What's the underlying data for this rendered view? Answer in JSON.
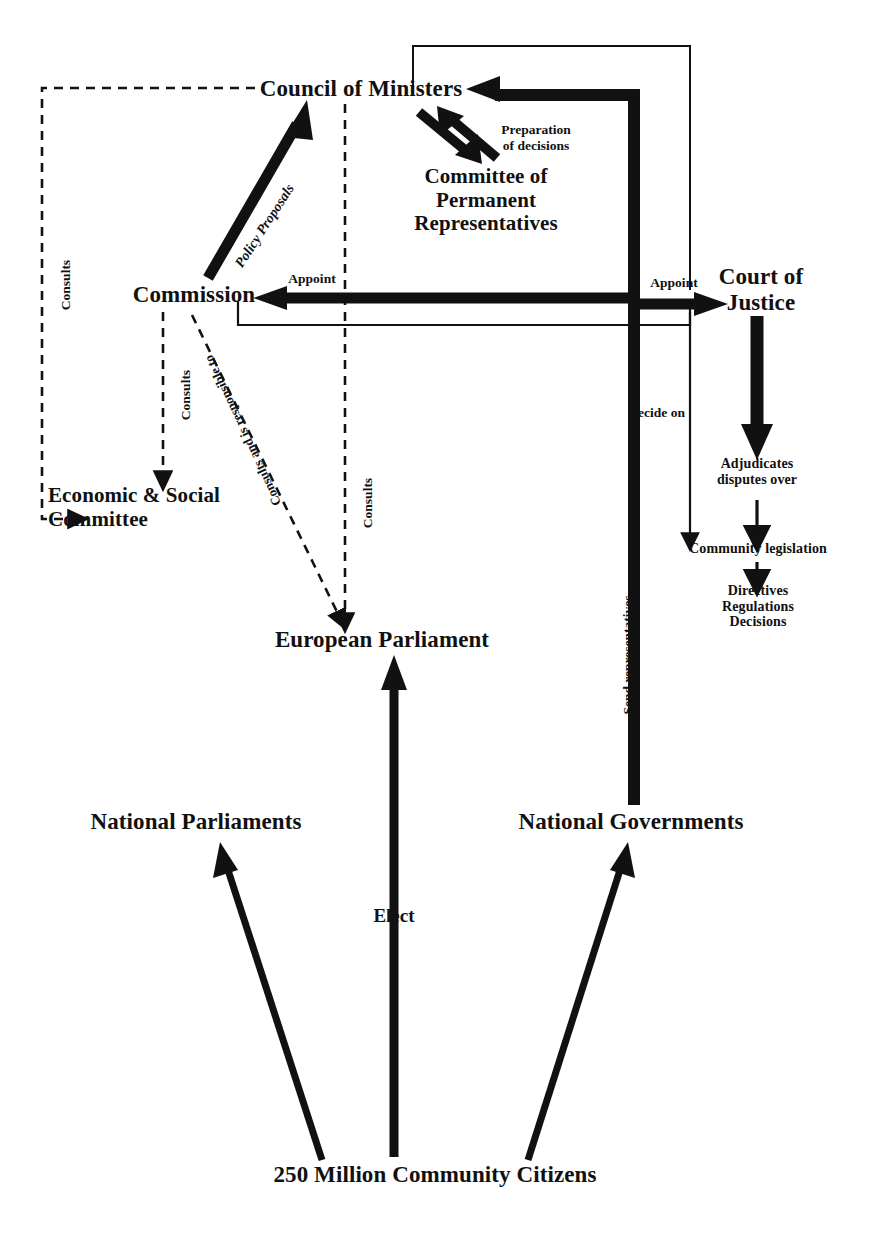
{
  "diagram": {
    "colors": {
      "ink": "#111111",
      "background": "#ffffff"
    },
    "nodes": [
      {
        "id": "council",
        "label": "Council of Ministers"
      },
      {
        "id": "coreper",
        "label": "Committee of\nPermanent\nRepresentatives"
      },
      {
        "id": "commission",
        "label": "Commission"
      },
      {
        "id": "court",
        "label": "Court of\nJustice"
      },
      {
        "id": "esc",
        "label": "Economic & Social\nCommittee"
      },
      {
        "id": "ep",
        "label": "European Parliament"
      },
      {
        "id": "natparl",
        "label": "National Parliaments"
      },
      {
        "id": "natgov",
        "label": "National Governments"
      },
      {
        "id": "citizens",
        "label": "250 Million Community Citizens"
      },
      {
        "id": "adjudicates",
        "label": "Adjudicates\ndisputes over"
      },
      {
        "id": "comleg",
        "label": "Community legislation"
      },
      {
        "id": "acts",
        "label": "Directives\nRegulations\nDecisions"
      }
    ],
    "edges": [
      {
        "id": "e-policy",
        "label": "Policy Proposals",
        "from": "commission",
        "to": "council",
        "style": "thick-solid"
      },
      {
        "id": "e-prep",
        "label": "Preparation\nof decisions",
        "from": "coreper",
        "to": "council",
        "style": "thick-double"
      },
      {
        "id": "e-appoint-commission",
        "label": "Appoint",
        "from": "natgov",
        "to": "commission",
        "style": "thick-solid"
      },
      {
        "id": "e-appoint-court",
        "label": "Appoint",
        "from": "natgov",
        "to": "court",
        "style": "thick-solid"
      },
      {
        "id": "e-consults-council-esc",
        "label": "Consults",
        "from": "council",
        "to": "esc",
        "style": "dashed"
      },
      {
        "id": "e-consults-commission-esc",
        "label": "Consults",
        "from": "commission",
        "to": "esc",
        "style": "dashed"
      },
      {
        "id": "e-consults-council-ep",
        "label": "Consults",
        "from": "council",
        "to": "ep",
        "style": "dashed"
      },
      {
        "id": "e-responsible",
        "label": "Consults and is responsible to",
        "from": "commission",
        "to": "ep",
        "style": "dashed"
      },
      {
        "id": "e-decide",
        "label": "Decide on",
        "from": "council",
        "to": "comleg",
        "style": "thin-solid"
      },
      {
        "id": "e-send",
        "label": "Send representatives",
        "from": "natgov",
        "to": "council",
        "style": "thick-solid"
      },
      {
        "id": "e-elect",
        "label": "Elect",
        "from": "citizens",
        "to": "ep",
        "style": "thick-solid"
      },
      {
        "id": "e-elect-natparl",
        "label": "",
        "from": "citizens",
        "to": "natparl",
        "style": "thick-solid"
      },
      {
        "id": "e-elect-natgov",
        "label": "",
        "from": "citizens",
        "to": "natgov",
        "style": "thick-solid"
      },
      {
        "id": "e-court-adjudicates",
        "label": "",
        "from": "court",
        "to": "adjudicates",
        "style": "thick-solid"
      },
      {
        "id": "e-adjudicates-comleg",
        "label": "",
        "from": "adjudicates",
        "to": "comleg",
        "style": "thin-solid"
      },
      {
        "id": "e-comleg-acts",
        "label": "",
        "from": "comleg",
        "to": "acts",
        "style": "thin-solid"
      }
    ],
    "edge_labels": {
      "policy_proposals": "Policy Proposals",
      "preparation_of_decisions": "Preparation\nof decisions",
      "appoint_commission": "Appoint",
      "appoint_court": "Appoint",
      "consults_left": "Consults",
      "consults_esc": "Consults",
      "consults_ep": "Consults",
      "responsible_to": "Consults and is responsible to",
      "decide_on": "Decide on",
      "send_representatives": "Send representatives",
      "elect": "Elect"
    }
  }
}
